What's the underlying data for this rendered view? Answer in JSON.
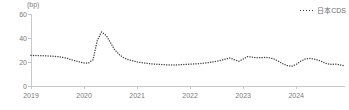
{
  "chart_data": {
    "type": "line",
    "title": "",
    "subtitle": "",
    "unit_label": "(bp)",
    "xlabel": "",
    "ylabel": "",
    "ylim": [
      0,
      60
    ],
    "xlim": [
      2019.0,
      2024.92
    ],
    "yticks": [
      0,
      20,
      40,
      60
    ],
    "xticks": [
      2019,
      2020,
      2021,
      2022,
      2023,
      2024
    ],
    "xtick_labels": [
      "2019",
      "2020",
      "2021",
      "2022",
      "2023",
      "2024"
    ],
    "ytick_labels": [
      "0",
      "20",
      "40",
      "60"
    ],
    "grid": false,
    "legend_position": "top-right",
    "marker": "dotted-square",
    "series_color": "#3d3d3d",
    "axis_color": "#c9c9c9",
    "text_color": "#7a7a7a",
    "series": [
      {
        "name": "日本CDS",
        "x": [
          2019.0,
          2019.08,
          2019.17,
          2019.25,
          2019.33,
          2019.42,
          2019.5,
          2019.58,
          2019.67,
          2019.75,
          2019.83,
          2019.92,
          2020.0,
          2020.08,
          2020.17,
          2020.25,
          2020.33,
          2020.42,
          2020.5,
          2020.58,
          2020.67,
          2020.75,
          2020.83,
          2020.92,
          2021.0,
          2021.08,
          2021.17,
          2021.25,
          2021.33,
          2021.42,
          2021.5,
          2021.58,
          2021.67,
          2021.75,
          2021.83,
          2021.92,
          2022.0,
          2022.08,
          2022.17,
          2022.25,
          2022.33,
          2022.42,
          2022.5,
          2022.58,
          2022.67,
          2022.75,
          2022.83,
          2022.92,
          2023.0,
          2023.08,
          2023.17,
          2023.25,
          2023.33,
          2023.42,
          2023.5,
          2023.58,
          2023.67,
          2023.75,
          2023.83,
          2023.92,
          2024.0,
          2024.08,
          2024.17,
          2024.25,
          2024.33,
          2024.42,
          2024.5,
          2024.58,
          2024.67,
          2024.75,
          2024.83,
          2024.92
        ],
        "values": [
          25.5,
          25.4,
          25.3,
          25.2,
          25.0,
          24.8,
          24.5,
          24.0,
          23.2,
          22.0,
          21.0,
          20.0,
          19.2,
          19.0,
          22.0,
          38.0,
          45.0,
          42.0,
          36.0,
          30.0,
          26.0,
          23.5,
          22.0,
          21.0,
          20.0,
          19.5,
          19.0,
          18.5,
          18.2,
          18.0,
          17.8,
          17.6,
          17.5,
          17.6,
          17.8,
          18.0,
          18.2,
          18.4,
          18.6,
          19.0,
          19.4,
          20.0,
          20.6,
          21.4,
          22.4,
          23.4,
          22.0,
          20.6,
          22.5,
          24.5,
          24.0,
          23.5,
          23.6,
          23.8,
          23.5,
          22.5,
          20.5,
          18.5,
          17.0,
          16.5,
          18.0,
          20.5,
          22.5,
          23.0,
          22.5,
          21.5,
          20.0,
          18.5,
          18.0,
          18.2,
          17.5,
          16.8
        ]
      }
    ]
  },
  "legend": {
    "entries": [
      {
        "label": "日本CDS"
      }
    ]
  }
}
